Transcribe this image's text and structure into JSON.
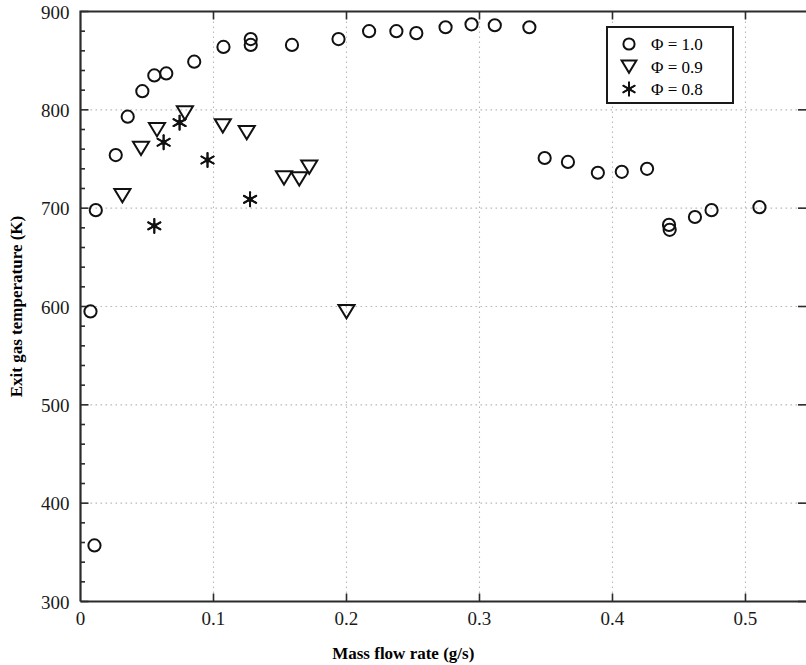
{
  "chart_data": {
    "type": "scatter",
    "title": "",
    "xlabel": "Mass flow rate (g/s)",
    "ylabel": "Exit gas temperature (K)",
    "xlim": [
      0,
      0.5455
    ],
    "ylim": [
      300,
      900
    ],
    "xticks": [
      0,
      0.1,
      0.2,
      0.3,
      0.4,
      0.5
    ],
    "xtick_labels": [
      "0",
      "0.1",
      "0.2",
      "0.3",
      "0.4",
      "0.5"
    ],
    "yticks": [
      300,
      400,
      500,
      600,
      700,
      800,
      900
    ],
    "ytick_labels": [
      "300",
      "400",
      "500",
      "600",
      "700",
      "800",
      "900"
    ],
    "grid": true,
    "grid_style": "dotted",
    "legend_position": "top-right",
    "series": [
      {
        "name": "Φ = 1.0",
        "marker": "circle-open",
        "color": "#111111",
        "points": [
          [
            0.0105,
            357
          ],
          [
            0.0075,
            595
          ],
          [
            0.0115,
            698
          ],
          [
            0.0265,
            754
          ],
          [
            0.0355,
            793
          ],
          [
            0.0465,
            819
          ],
          [
            0.0555,
            835
          ],
          [
            0.0645,
            837
          ],
          [
            0.0855,
            849
          ],
          [
            0.1075,
            864
          ],
          [
            0.128,
            872
          ],
          [
            0.128,
            866
          ],
          [
            0.159,
            866
          ],
          [
            0.194,
            872
          ],
          [
            0.217,
            880
          ],
          [
            0.2375,
            880
          ],
          [
            0.2525,
            878
          ],
          [
            0.2745,
            884
          ],
          [
            0.294,
            887
          ],
          [
            0.3115,
            886
          ],
          [
            0.3375,
            884
          ],
          [
            0.349,
            751
          ],
          [
            0.3665,
            747
          ],
          [
            0.389,
            736
          ],
          [
            0.407,
            737
          ],
          [
            0.426,
            740
          ],
          [
            0.4425,
            683
          ],
          [
            0.443,
            678
          ],
          [
            0.462,
            691
          ],
          [
            0.4745,
            698
          ],
          [
            0.5105,
            701
          ]
        ]
      },
      {
        "name": "Φ = 0.9",
        "marker": "triangle-down-open",
        "color": "#111111",
        "points": [
          [
            0.0315,
            713
          ],
          [
            0.0455,
            761
          ],
          [
            0.0575,
            780
          ],
          [
            0.0785,
            797
          ],
          [
            0.107,
            784
          ],
          [
            0.125,
            777
          ],
          [
            0.153,
            731
          ],
          [
            0.1645,
            730
          ],
          [
            0.172,
            742
          ],
          [
            0.2,
            595
          ]
        ]
      },
      {
        "name": "Φ = 0.8",
        "marker": "star",
        "color": "#111111",
        "points": [
          [
            0.0555,
            682
          ],
          [
            0.0625,
            767
          ],
          [
            0.0745,
            787
          ],
          [
            0.0955,
            749
          ],
          [
            0.1275,
            709
          ]
        ]
      }
    ]
  },
  "legend": {
    "entries": [
      {
        "label": "Φ = 1.0",
        "marker": "circle-open"
      },
      {
        "label": "Φ = 0.9",
        "marker": "triangle-down-open"
      },
      {
        "label": "Φ = 0.8",
        "marker": "star"
      }
    ]
  }
}
